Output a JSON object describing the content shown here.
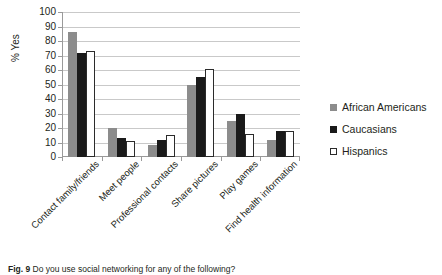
{
  "chart_data": {
    "type": "bar",
    "title": "",
    "xlabel": "",
    "ylabel": "% Yes",
    "ylim": [
      0,
      100
    ],
    "ytick_step": 10,
    "yticks": [
      100,
      90,
      80,
      70,
      60,
      50,
      40,
      30,
      20,
      10,
      0
    ],
    "grid": "horizontal",
    "legend_position": "right",
    "categories": [
      "Contact family/friends",
      "Meet people",
      "Professional contacts",
      "Share pictures",
      "Play games",
      "Find health information"
    ],
    "series": [
      {
        "name": "African Americans",
        "color": "#8c8c8c",
        "values": [
          86,
          20,
          8,
          50,
          25,
          12
        ]
      },
      {
        "name": "Caucasians",
        "color": "#1a1a1a",
        "values": [
          72,
          13,
          12,
          55,
          30,
          18
        ]
      },
      {
        "name": "Hispanics",
        "color": "#ffffff",
        "values": [
          73,
          11,
          15,
          61,
          16,
          18
        ]
      }
    ]
  },
  "axis": {
    "y_title": "% Yes"
  },
  "legend": {
    "entries": [
      {
        "label": "African Americans"
      },
      {
        "label": "Caucasians"
      },
      {
        "label": "Hispanics"
      }
    ]
  },
  "caption": {
    "figure_number": "Fig. 9",
    "text": "Do you use social networking for any of the following?"
  }
}
